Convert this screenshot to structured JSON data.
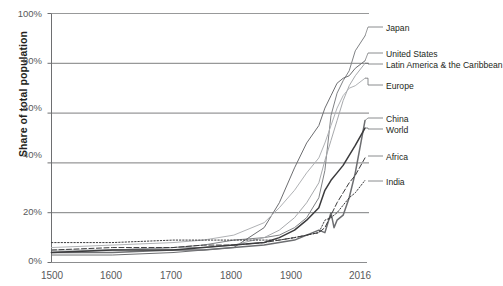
{
  "chart_data": {
    "type": "line",
    "title": "",
    "xlabel": "",
    "ylabel": "Share of total population",
    "xticks": [
      "1500",
      "1600",
      "1700",
      "1800",
      "1900",
      "2016"
    ],
    "xtick_values": [
      1500,
      1600,
      1700,
      1800,
      1900,
      2016
    ],
    "yticks": [
      "0%",
      "20%",
      "40%",
      "60%",
      "80%",
      "100%"
    ],
    "ytick_values": [
      0,
      20,
      40,
      60,
      80,
      100
    ],
    "ylim": [
      0,
      100
    ],
    "xlim": [
      1500,
      2016
    ],
    "grid": "horizontal",
    "legend_position": "right-inline-labels",
    "series": [
      {
        "name": "Japan",
        "color": "#808285",
        "style": "solid",
        "label_y_pct": 91,
        "x": [
          1500,
          1600,
          1700,
          1750,
          1800,
          1850,
          1875,
          1900,
          1920,
          1940,
          1950,
          1955,
          1960,
          1970,
          1980,
          1990,
          2000,
          2016
        ],
        "y": [
          4,
          5,
          6,
          7,
          9,
          10,
          11,
          14,
          18,
          26,
          37,
          48,
          59,
          68,
          73,
          77,
          85,
          91
        ]
      },
      {
        "name": "United States",
        "color": "#6d6e71",
        "style": "solid",
        "label_y_pct": 81,
        "x": [
          1500,
          1600,
          1700,
          1750,
          1800,
          1850,
          1875,
          1900,
          1920,
          1940,
          1950,
          1960,
          1970,
          1980,
          1990,
          2000,
          2016
        ],
        "y": [
          3,
          3,
          4,
          5,
          6,
          14,
          24,
          38,
          48,
          55,
          62,
          67,
          72,
          74,
          75,
          78,
          81
        ]
      },
      {
        "name": "Latin America & the Caribbean",
        "color": "#a7a9ac",
        "style": "solid",
        "label_y_pct": 80,
        "x": [
          1500,
          1600,
          1700,
          1750,
          1800,
          1850,
          1875,
          1900,
          1920,
          1940,
          1950,
          1960,
          1970,
          1980,
          1990,
          2000,
          2016
        ],
        "y": [
          5,
          5,
          6,
          6,
          7,
          10,
          13,
          18,
          24,
          32,
          41,
          49,
          57,
          65,
          71,
          75,
          80
        ]
      },
      {
        "name": "Europe",
        "color": "#b0b2b5",
        "style": "solid",
        "label_y_pct": 74,
        "x": [
          1500,
          1600,
          1700,
          1750,
          1800,
          1850,
          1875,
          1900,
          1920,
          1940,
          1950,
          1960,
          1970,
          1980,
          1990,
          2000,
          2016
        ],
        "y": [
          6,
          7,
          8,
          9,
          11,
          16,
          22,
          29,
          36,
          42,
          48,
          55,
          62,
          67,
          70,
          71,
          74
        ]
      },
      {
        "name": "China",
        "color": "#6d6e71",
        "style": "solid",
        "label_y_pct": 57,
        "x": [
          1500,
          1600,
          1700,
          1750,
          1800,
          1850,
          1875,
          1900,
          1920,
          1940,
          1950,
          1960,
          1965,
          1970,
          1980,
          1990,
          2000,
          2016
        ],
        "y": [
          4,
          4,
          5,
          5,
          6,
          7,
          8,
          9,
          11,
          13,
          12,
          20,
          14,
          17,
          19,
          26,
          36,
          57
        ]
      },
      {
        "name": "World",
        "color": "#3b3b3d",
        "style": "solid",
        "label_y_pct": 54,
        "x": [
          1500,
          1600,
          1700,
          1750,
          1800,
          1850,
          1875,
          1900,
          1920,
          1940,
          1950,
          1960,
          1970,
          1980,
          1990,
          2000,
          2016
        ],
        "y": [
          4,
          5,
          5,
          6,
          7,
          8,
          10,
          13,
          17,
          22,
          29,
          33,
          36,
          39,
          43,
          47,
          54
        ]
      },
      {
        "name": "Africa",
        "color": "#3b3b3d",
        "style": "dashed",
        "label_y_pct": 42,
        "x": [
          1500,
          1600,
          1700,
          1750,
          1800,
          1850,
          1875,
          1900,
          1920,
          1940,
          1950,
          1960,
          1970,
          1980,
          1990,
          2000,
          2016
        ],
        "y": [
          5,
          6,
          6,
          7,
          7,
          8,
          9,
          10,
          11,
          12,
          14,
          19,
          24,
          28,
          32,
          35,
          42
        ]
      },
      {
        "name": "India",
        "color": "#3b3b3d",
        "style": "dotted",
        "label_y_pct": 33,
        "x": [
          1500,
          1600,
          1700,
          1750,
          1800,
          1850,
          1875,
          1900,
          1920,
          1940,
          1950,
          1960,
          1970,
          1980,
          1990,
          2000,
          2016
        ],
        "y": [
          8,
          8,
          9,
          9,
          9,
          9,
          9,
          10,
          11,
          12,
          17,
          18,
          20,
          23,
          26,
          28,
          33
        ]
      }
    ]
  }
}
